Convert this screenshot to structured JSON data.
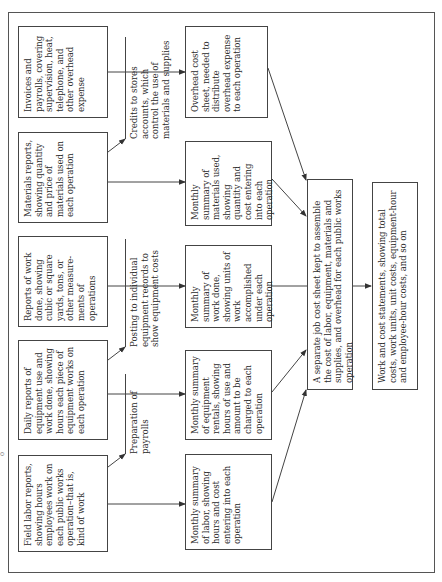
{
  "diagram": {
    "type": "flowchart",
    "orientation": "rotated 90 degrees counter-clockwise",
    "sources": [
      {
        "id": "field-labor",
        "text": "Field labor reports, showing hours employees work on each public works operation–that is, kind of work"
      },
      {
        "id": "daily-equipment",
        "text": "Daily reports of equipment use and work done, showing hours each piece of equipment works on each operation"
      },
      {
        "id": "work-done",
        "text": "Reports of work done, showing cubic or square yards, tons, or other measure-ments of operations"
      },
      {
        "id": "materials",
        "text": "Materials reports, showing quantity and price of materials used on each operation"
      },
      {
        "id": "invoices",
        "text": "Invoices and payrolls, covering supervision, heat, telephone, and other overhead expense"
      }
    ],
    "annotations": [
      {
        "id": "payrolls",
        "text": "Preparation of payrolls"
      },
      {
        "id": "equipment-records",
        "text": "Posting to individual equipment records to show equipment costs"
      },
      {
        "id": "stores-credits",
        "text": "Credits to stores accounts, which control the use of materials and supplies"
      }
    ],
    "summaries": [
      {
        "id": "labor-summary",
        "text": "Monthly summary of labor, showing hours and cost entering into each operation"
      },
      {
        "id": "equipment-summary",
        "text": "Monthly summary of equipment rentals, showing hours of use and amount to be charged to each operation"
      },
      {
        "id": "work-summary",
        "text": "Monthly summary of work done, showing units of work accomplished under each operation"
      },
      {
        "id": "materials-summary",
        "text": "Monthly summary of materials used, showing quantity and cost entering into each operation"
      },
      {
        "id": "overhead-sheet",
        "text": "Overhead cost sheet, needed to distribute overhead expense to each operation"
      }
    ],
    "job_cost_sheet": {
      "text": "A separate job cost sheet kept to assemble the cost of labor, equipment, materials and supplies, and overhead for each public works operation"
    },
    "statements": {
      "text": "Work and cost statements, showing total costs, work units, unit costs, equipment-hour and employee-hour costs, and so on"
    },
    "stray_mark": "o",
    "colors": {
      "line": "#444444",
      "text": "#2a2a2a",
      "background": "#ffffff"
    }
  }
}
